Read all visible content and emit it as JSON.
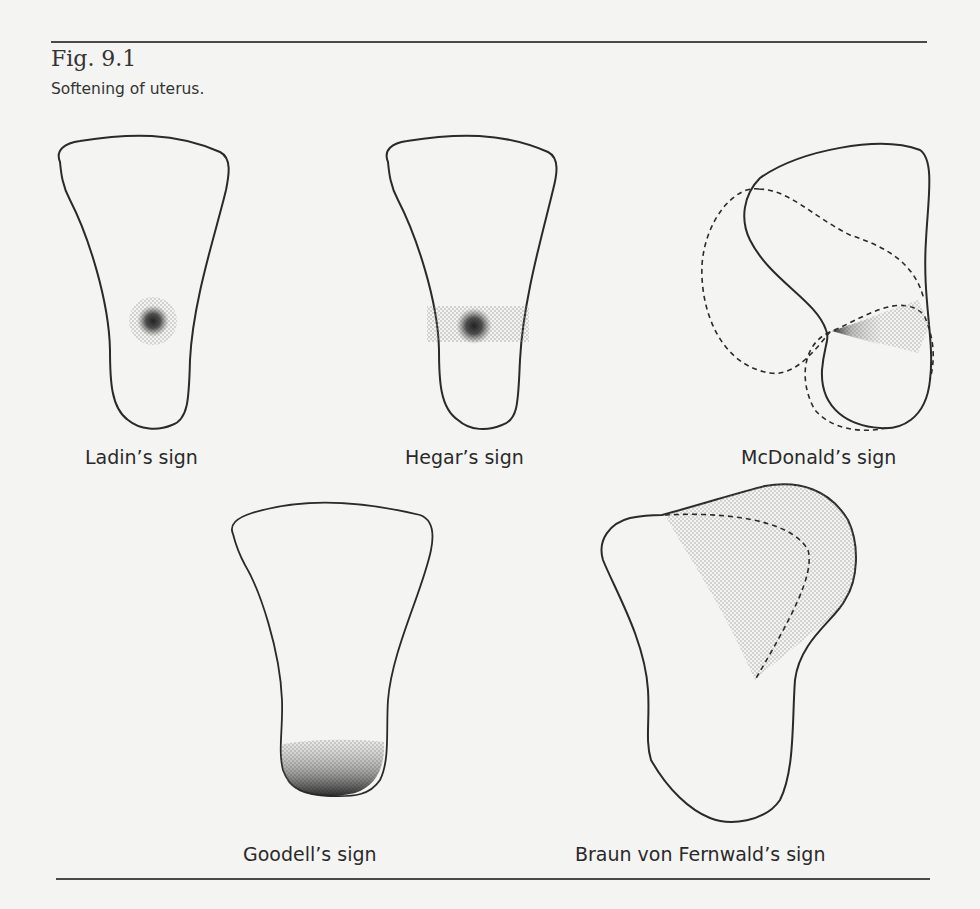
{
  "figure": {
    "label": "Fig. 9.1",
    "caption": "Softening of uterus."
  },
  "signs": [
    {
      "name": "Ladin's sign",
      "label": "Ladin’s sign"
    },
    {
      "name": "Hegar's sign",
      "label": "Hegar’s sign"
    },
    {
      "name": "McDonald's sign",
      "label": "McDonald’s sign"
    },
    {
      "name": "Goodell's sign",
      "label": "Goodell’s sign"
    },
    {
      "name": "Braun von Fernwald's sign",
      "label": "Braun von Fernwald’s sign"
    }
  ],
  "colors": {
    "outline": "#2a2a2a",
    "stipple_light": "#b8b8b8",
    "stipple_dark": "#2a2a2a",
    "background": "#f4f4f2"
  }
}
